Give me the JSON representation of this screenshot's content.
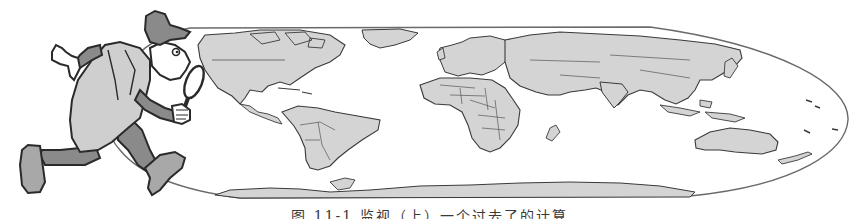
{
  "figure": {
    "caption": "图 11-1  监视（上）一个过去了的计算",
    "colors": {
      "land": "#d4d4d4",
      "ocean": "#ffffff",
      "outline": "#3a3a3a",
      "border": "#555555",
      "coat": "#cfcfcf",
      "dark_cloth": "#8a8a8a",
      "skin": "#ffffff"
    }
  },
  "illustration": {
    "character": "detective-with-magnifying-glass",
    "map": "world-map-elliptical-projection"
  }
}
